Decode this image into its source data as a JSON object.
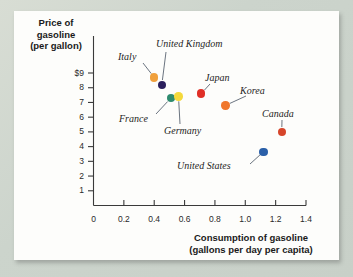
{
  "chart_data": {
    "type": "scatter",
    "title": "",
    "xlabel": "Consumption of gasoline (gallons per day per capita)",
    "ylabel": "Price of gasoline (per gallon)",
    "xlabel_line1": "Consumption of gasoline",
    "xlabel_line2": "(gallons per day per capita)",
    "ylabel_line1": "Price of",
    "ylabel_line2": "gasoline",
    "ylabel_line3": "(per gallon)",
    "xlim": [
      0,
      1.4
    ],
    "ylim": [
      0,
      9
    ],
    "grid": false,
    "legend": "none",
    "xticks": [
      "0",
      "0.2",
      "0.4",
      "0.6",
      "0.8",
      "1.0",
      "1.2",
      "1.4"
    ],
    "xtick_values": [
      0,
      0.2,
      0.4,
      0.6,
      0.8,
      1.0,
      1.2,
      1.4
    ],
    "yticks": [
      "0",
      "1",
      "2",
      "3",
      "4",
      "5",
      "6",
      "7",
      "8",
      "$9"
    ],
    "ytick_values": [
      0,
      1,
      2,
      3,
      4,
      5,
      6,
      7,
      8,
      9
    ],
    "points": [
      {
        "label": "Italy",
        "x": 0.4,
        "y": 8.7,
        "color": "#f0a03c"
      },
      {
        "label": "United Kingdom",
        "x": 0.45,
        "y": 8.2,
        "color": "#2b1f5c"
      },
      {
        "label": "France",
        "x": 0.51,
        "y": 7.3,
        "color": "#2e8b6f"
      },
      {
        "label": "Germany",
        "x": 0.56,
        "y": 7.4,
        "color": "#f4d93c"
      },
      {
        "label": "Japan",
        "x": 0.71,
        "y": 7.6,
        "color": "#e02f26"
      },
      {
        "label": "Korea",
        "x": 0.87,
        "y": 6.8,
        "color": "#f0772c"
      },
      {
        "label": "Canada",
        "x": 1.24,
        "y": 5.0,
        "color": "#d6452a"
      },
      {
        "label": "United States",
        "x": 1.12,
        "y": 3.65,
        "color": "#2a5fa8"
      }
    ]
  },
  "annotations": {
    "italy": "Italy",
    "united_kingdom": "United Kingdom",
    "france": "France",
    "germany": "Germany",
    "japan": "Japan",
    "korea": "Korea",
    "canada": "Canada",
    "united_states": "United States"
  }
}
